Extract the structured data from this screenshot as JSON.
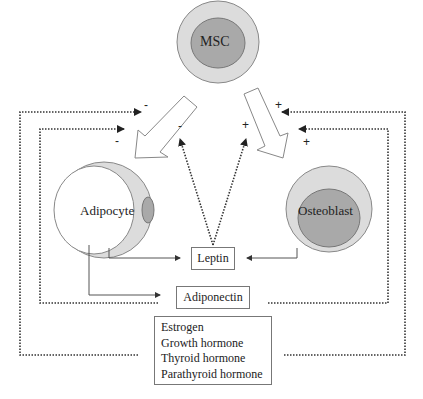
{
  "diagram": {
    "nodes": {
      "msc": {
        "label": "MSC"
      },
      "adipocyte": {
        "label": "Adipocyte"
      },
      "osteoblast": {
        "label": "Osteoblast"
      },
      "leptin": {
        "label": "Leptin"
      },
      "adiponectin": {
        "label": "Adiponectin"
      },
      "hormones": {
        "items": [
          "Estrogen",
          "Growth hormone",
          "Thyroid hormone",
          "Parathyroid hormone"
        ]
      }
    },
    "signs": {
      "msc_to_adipocyte_outer": "-",
      "msc_to_adipocyte_inner": "-",
      "leptin_to_adipocyte": "-",
      "leptin_to_osteoblast": "+",
      "msc_to_osteoblast_outer": "+",
      "msc_to_osteoblast_inner": "+"
    },
    "colors": {
      "outer_cell": "#dcdcdc",
      "inner_nucleus": "#a9a9a9",
      "line": "#333333",
      "box_border": "#777777"
    }
  }
}
